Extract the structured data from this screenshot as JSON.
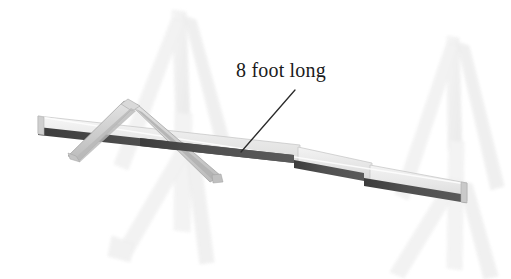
{
  "image": {
    "title": "8 foot long board on sawhorses",
    "width": 511,
    "height": 279,
    "background_color": "#ffffff"
  },
  "annotations": [
    {
      "id": "length-callout",
      "text": "8 foot long",
      "text_color": "#1b1b1b",
      "x": 236,
      "y": 58,
      "leader_line": {
        "from_x": 295,
        "from_y": 90,
        "to_x": 241,
        "to_y": 152,
        "color": "#2b2b2b",
        "width": 1.3
      }
    }
  ],
  "objects": {
    "main_board": {
      "name": "long-board",
      "description": "Long plank spanning left to right, tilted downward to the right",
      "top_face_color": "#e9e9e9",
      "top_face_highlight": "#f4f4f4",
      "edge_color": "#4a4a4a",
      "outline_color": "#bcbcbc",
      "left_tip_x": 38,
      "left_tip_y": 116,
      "right_tip_x": 467,
      "right_tip_y": 192,
      "notches": [
        295,
        365
      ]
    },
    "crossing_board": {
      "name": "v-shaped-board",
      "description": "Inverted V shaped board laid across the long board near the left sawhorse",
      "face_color": "#d6d6d6",
      "shade_color": "#b5b5b5",
      "outline_color": "#9a9a9a",
      "apex_x": 127,
      "apex_y": 103,
      "left_foot_x": 68,
      "left_foot_y": 157,
      "right_foot_x": 219,
      "right_foot_y": 179
    },
    "sawhorse_left": {
      "name": "sawhorse-left",
      "description": "Faint A-frame sawhorse behind the board on the left",
      "color": "#f1f1f1",
      "shade_color": "#e6e6e6",
      "apex_x": 178,
      "apex_y": 12
    },
    "sawhorse_right": {
      "name": "sawhorse-right",
      "description": "Faint A-frame sawhorse behind the board on the right",
      "color": "#f1f1f1",
      "shade_color": "#e6e6e6",
      "apex_x": 452,
      "apex_y": 38
    }
  },
  "colors": {
    "paper": "#ffffff",
    "ink_dark": "#2b2b2b",
    "board_edge": "#4a4a4a",
    "board_face": "#e9e9e9",
    "cross_board": "#d6d6d6",
    "sawhorse_faint": "#f1f1f1"
  }
}
